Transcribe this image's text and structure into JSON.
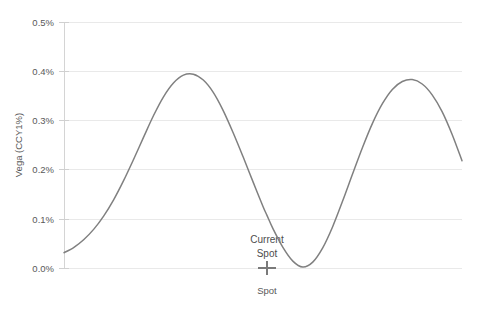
{
  "chart_data": {
    "type": "line",
    "title": "",
    "subtitle": "",
    "xlabel": "Spot",
    "ylabel": "Vega (CCY1%)",
    "grid": true,
    "legend": "none",
    "ylim": [
      0.0,
      0.5
    ],
    "ytick_labels": [
      "0.0%",
      "0.1%",
      "0.2%",
      "0.3%",
      "0.4%",
      "0.5%"
    ],
    "ytick_values": [
      0.0,
      0.1,
      0.2,
      0.3,
      0.4,
      0.5
    ],
    "xtick_labels": [],
    "annotations": [
      {
        "name": "current-spot",
        "label_line1": "Current",
        "label_line2": "Spot",
        "marker": "cross",
        "x_norm": 0.51,
        "y_value": 0.0
      }
    ],
    "series": [
      {
        "name": "Vega",
        "color": "#808080",
        "x_norm": [
          0.0,
          0.025,
          0.05,
          0.075,
          0.1,
          0.125,
          0.15,
          0.175,
          0.2,
          0.225,
          0.25,
          0.275,
          0.3,
          0.325,
          0.35,
          0.375,
          0.4,
          0.425,
          0.45,
          0.475,
          0.5,
          0.51,
          0.525,
          0.55,
          0.575,
          0.6,
          0.625,
          0.65,
          0.675,
          0.7,
          0.725,
          0.75,
          0.775,
          0.8,
          0.825,
          0.85,
          0.875,
          0.9,
          0.925,
          0.95,
          0.975,
          1.0
        ],
        "values": [
          0.031,
          0.042,
          0.058,
          0.079,
          0.106,
          0.139,
          0.178,
          0.221,
          0.266,
          0.31,
          0.348,
          0.376,
          0.392,
          0.394,
          0.382,
          0.357,
          0.32,
          0.275,
          0.226,
          0.175,
          0.125,
          0.107,
          0.08,
          0.042,
          0.014,
          0.002,
          0.012,
          0.041,
          0.084,
          0.136,
          0.191,
          0.245,
          0.294,
          0.334,
          0.363,
          0.379,
          0.383,
          0.374,
          0.352,
          0.318,
          0.272,
          0.218
        ]
      }
    ]
  },
  "plot_geometry": {
    "left": 64,
    "right": 462,
    "top": 22,
    "bottom": 268
  }
}
